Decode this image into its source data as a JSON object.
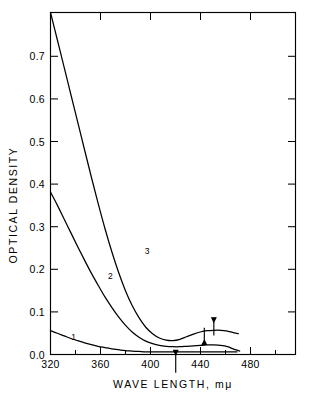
{
  "chart_data": {
    "type": "line",
    "title": "",
    "xlabel": "WAVE  LENGTH,  mμ",
    "ylabel": "OPTICAL  DENSITY",
    "xlim": [
      320,
      500
    ],
    "ylim": [
      0.0,
      0.79
    ],
    "grid": false,
    "legend_position": "inline-curve-labels",
    "xticks": [
      320,
      360,
      400,
      440,
      480
    ],
    "xtick_labels": [
      "320",
      "360",
      "400",
      "440",
      "480"
    ],
    "xticks_minor": [
      340,
      380,
      420,
      460
    ],
    "yticks": [
      0.0,
      0.1,
      0.2,
      0.3,
      0.4,
      0.5,
      0.6,
      0.7
    ],
    "ytick_labels": [
      "0.0",
      "0.1",
      "0.2",
      "0.3",
      "0.4",
      "0.5",
      "0.6",
      "0.7"
    ],
    "series": [
      {
        "name": "1",
        "label": "1",
        "label_x": 337,
        "label_y": 0.033,
        "x": [
          320,
          325,
          330,
          335,
          340,
          345,
          350,
          355,
          360,
          365,
          370,
          375,
          380,
          385,
          390,
          395,
          400,
          410,
          420,
          430,
          440,
          450,
          457
        ],
        "values": [
          0.055,
          0.049,
          0.043,
          0.037,
          0.032,
          0.027,
          0.023,
          0.019,
          0.016,
          0.013,
          0.011,
          0.009,
          0.008,
          0.007,
          0.006,
          0.006,
          0.006,
          0.006,
          0.006,
          0.006,
          0.006,
          0.006,
          0.006
        ]
      },
      {
        "name": "2",
        "label": "2",
        "label_x": 364,
        "label_y": 0.175,
        "x": [
          320,
          325,
          330,
          335,
          340,
          345,
          350,
          355,
          360,
          365,
          370,
          375,
          380,
          385,
          390,
          395,
          400,
          405,
          410,
          415,
          420,
          425,
          430,
          435,
          440,
          445,
          450,
          455,
          459
        ],
        "values": [
          0.375,
          0.345,
          0.313,
          0.281,
          0.249,
          0.218,
          0.188,
          0.16,
          0.133,
          0.109,
          0.087,
          0.068,
          0.052,
          0.04,
          0.031,
          0.025,
          0.021,
          0.019,
          0.018,
          0.018,
          0.019,
          0.02,
          0.021,
          0.022,
          0.022,
          0.021,
          0.018,
          0.012,
          0.008
        ]
      },
      {
        "name": "3",
        "label": "3",
        "label_x": 391,
        "label_y": 0.232,
        "x": [
          320,
          325,
          330,
          335,
          340,
          345,
          350,
          355,
          360,
          365,
          370,
          375,
          380,
          385,
          390,
          395,
          400,
          405,
          410,
          415,
          420,
          425,
          430,
          435,
          440,
          445,
          450,
          455,
          458
        ],
        "values": [
          0.79,
          0.727,
          0.664,
          0.6,
          0.537,
          0.473,
          0.41,
          0.349,
          0.291,
          0.238,
          0.19,
          0.148,
          0.113,
          0.085,
          0.063,
          0.048,
          0.038,
          0.033,
          0.032,
          0.035,
          0.041,
          0.047,
          0.052,
          0.055,
          0.056,
          0.056,
          0.054,
          0.05,
          0.048
        ]
      }
    ],
    "annotations": [
      {
        "name": "arrow-down-marker",
        "direction": "down",
        "x": 433,
        "y_tip": 0.033,
        "y_tail": 0.062
      },
      {
        "name": "arrow-up-marker",
        "direction": "up",
        "x": 440,
        "y_tip": 0.075,
        "y_tail": 0.044
      },
      {
        "name": "arrow-axis-marker",
        "direction": "up",
        "x": 412,
        "y_tip": 0.0,
        "y_tail": -0.042
      }
    ]
  }
}
